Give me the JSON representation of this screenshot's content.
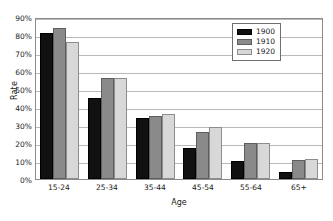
{
  "chart_data": {
    "type": "bar",
    "title": "",
    "xlabel": "Age",
    "ylabel": "Rate",
    "categories": [
      "15-24",
      "25-34",
      "35-44",
      "45-54",
      "55-64",
      "65+"
    ],
    "series": [
      {
        "name": "1900",
        "color": "#111111",
        "values": [
          81,
          45,
          34,
          17,
          10,
          4
        ]
      },
      {
        "name": "1910",
        "color": "#8a8a8a",
        "values": [
          84,
          56,
          35,
          26,
          20,
          10.5
        ]
      },
      {
        "name": "1920",
        "color": "#d8d8d8",
        "values": [
          76,
          56,
          36,
          29,
          20,
          11
        ]
      }
    ],
    "ylim": [
      0,
      90
    ],
    "ytick_step": 10,
    "ytick_labels": [
      "0%",
      "10%",
      "20%",
      "30%",
      "40%",
      "50%",
      "60%",
      "70%",
      "80%",
      "90%"
    ],
    "ytick_values": [
      0,
      10,
      20,
      30,
      40,
      50,
      60,
      70,
      80,
      90
    ],
    "grid": true,
    "grid_axis": "y",
    "legend_position": "top-right",
    "legend_entries": [
      "1900",
      "1910",
      "1920"
    ]
  }
}
